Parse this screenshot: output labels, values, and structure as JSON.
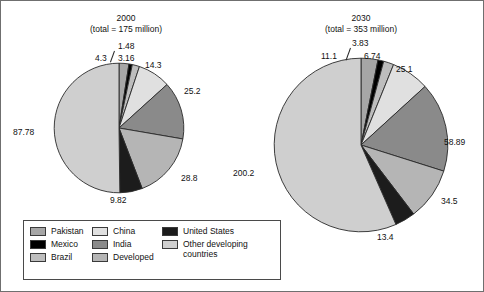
{
  "chart_data": [
    {
      "type": "pie",
      "title": "2000",
      "subtitle": "(total = 175 million)",
      "total": 175,
      "unit": "million",
      "categories": [
        "Pakistan",
        "Mexico",
        "Brazil",
        "China",
        "India",
        "Developed",
        "United States",
        "Other developing countries"
      ],
      "values": [
        4.3,
        1.48,
        3.16,
        14.3,
        25.2,
        28.8,
        9.82,
        87.78
      ],
      "labels": [
        "4.3",
        "1.48",
        "3.16",
        "14.3",
        "25.2",
        "28.8",
        "9.82",
        "87.78"
      ],
      "start_angle_deg": 0,
      "direction": "clockwise",
      "legend": "bottom-left",
      "grid": false
    },
    {
      "type": "pie",
      "title": "2030",
      "subtitle": "(total = 353 million)",
      "total": 353,
      "unit": "million",
      "categories": [
        "Pakistan",
        "Mexico",
        "Brazil",
        "China",
        "India",
        "Developed",
        "United States",
        "Other developing countries"
      ],
      "values": [
        11.1,
        3.83,
        6.74,
        25.1,
        58.89,
        34.5,
        13.4,
        200.2
      ],
      "labels": [
        "11.1",
        "3.83",
        "6.74",
        "25.1",
        "58.89",
        "34.5",
        "13.4",
        "200.2"
      ],
      "start_angle_deg": 0,
      "direction": "clockwise",
      "legend": "bottom-left",
      "grid": false
    }
  ],
  "colors": {
    "Pakistan": "#a6a6a6",
    "Mexico": "#000000",
    "Brazil": "#bdbdbd",
    "China": "#e0e0e0",
    "India": "#8a8a8a",
    "Developed": "#b5b5b5",
    "United States": "#1c1c1c",
    "Other developing countries": "#cfcfcf",
    "slice_stroke": "#2a2a2a",
    "frame": "#6f6f6f",
    "legend_border": "#4a4a4a",
    "text": "#111111"
  },
  "legend": {
    "items": [
      {
        "label": "Pakistan",
        "color_key": "Pakistan"
      },
      {
        "label": "China",
        "color_key": "China"
      },
      {
        "label": "United States",
        "color_key": "United States"
      },
      {
        "label": "Mexico",
        "color_key": "Mexico"
      },
      {
        "label": "India",
        "color_key": "India"
      },
      {
        "label": "Other developing countries",
        "color_key": "Other developing countries"
      },
      {
        "label": "Brazil",
        "color_key": "Brazil"
      },
      {
        "label": "Developed",
        "color_key": "Developed"
      }
    ]
  }
}
